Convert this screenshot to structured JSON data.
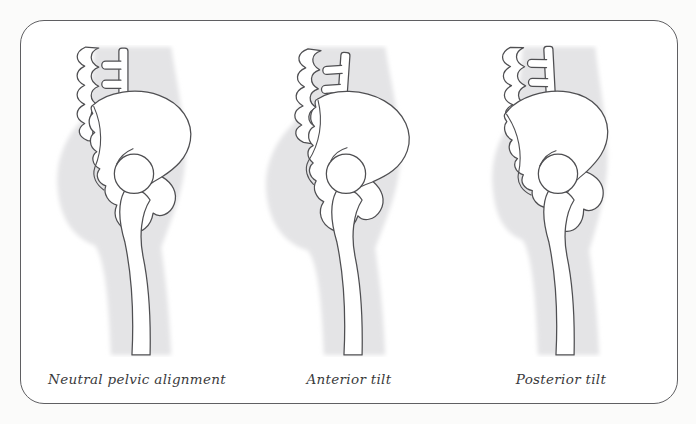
{
  "figure": {
    "type": "anatomical-diagram",
    "panels": [
      {
        "id": "neutral",
        "label": "Neutral pelvic alignment"
      },
      {
        "id": "anterior",
        "label": "Anterior tilt"
      },
      {
        "id": "posterior",
        "label": "Posterior tilt"
      }
    ]
  },
  "colors": {
    "background": "#fbfbfa",
    "frame_background": "#ffffff",
    "frame_border": "#5f5f62",
    "bone_outline": "#4f4f52",
    "bone_fill": "#ffffff",
    "body_silhouette": "#e4e4e6",
    "caption_text": "#3a3a3c"
  }
}
